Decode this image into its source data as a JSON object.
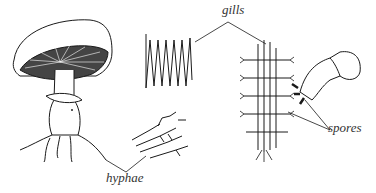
{
  "diagram": {
    "labels": {
      "gills": "gills",
      "hyphae": "hyphae",
      "spores": "spores"
    },
    "colors": {
      "ink": "#1a1a1a",
      "background": "#ffffff"
    }
  }
}
